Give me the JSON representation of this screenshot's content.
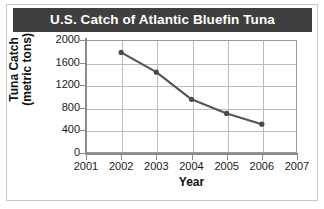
{
  "figure": {
    "title": "U.S. Catch of Atlantic Bluefin Tuna",
    "title_bar_color": "#3f3f3f",
    "title_text_color": "#ffffff",
    "background_color": "#ffffff",
    "border_color": "#c9c9c9"
  },
  "chart_data": {
    "type": "line",
    "title": "U.S. Catch of Atlantic Bluefin Tuna",
    "xlabel": "Year",
    "ylabel": "Tuna Catch (metric tons)",
    "ylabel_line1": "Tuna Catch",
    "ylabel_line2": "(metric tons)",
    "x": [
      2002,
      2003,
      2004,
      2005,
      2006
    ],
    "values": [
      1780,
      1430,
      950,
      700,
      510
    ],
    "xlim": [
      2001,
      2007
    ],
    "ylim": [
      0,
      2000
    ],
    "xticks": [
      2001,
      2002,
      2003,
      2004,
      2005,
      2006,
      2007
    ],
    "xtick_labels": [
      "2001",
      "2002",
      "2003",
      "2004",
      "2005",
      "2006",
      "2007"
    ],
    "yticks": [
      0,
      400,
      800,
      1200,
      1600,
      2000
    ],
    "ytick_labels": [
      "0",
      "400",
      "800",
      "1200",
      "1600",
      "2000"
    ],
    "grid": true,
    "legend": false,
    "line_color": "#555555",
    "marker_color": "#4a4a4a",
    "grid_color": "#bcbcbc",
    "axis_color": "#8a8a8a"
  }
}
